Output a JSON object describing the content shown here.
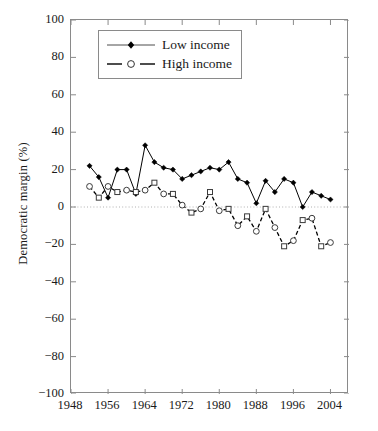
{
  "chart_data": {
    "type": "line",
    "title": "",
    "xlabel": "",
    "ylabel": "Democratic margin (%)",
    "xlim": [
      1948,
      2008
    ],
    "ylim": [
      -100,
      100
    ],
    "grid": false,
    "zero_line": true,
    "legend_position": "top-left",
    "x_ticks": [
      1948,
      1956,
      1964,
      1972,
      1980,
      1988,
      1996,
      2004
    ],
    "y_ticks": [
      100,
      80,
      60,
      40,
      20,
      0,
      -20,
      -40,
      -60,
      -80,
      -100
    ],
    "x": [
      1952,
      1954,
      1956,
      1958,
      1960,
      1962,
      1964,
      1966,
      1968,
      1970,
      1972,
      1974,
      1976,
      1978,
      1980,
      1982,
      1984,
      1986,
      1988,
      1990,
      1992,
      1994,
      1996,
      1998,
      2000,
      2002,
      2004
    ],
    "series": [
      {
        "name": "Low income",
        "marker": "filled-diamond",
        "line": "solid",
        "color": "#000000",
        "values": [
          22,
          16,
          5,
          20,
          20,
          7,
          33,
          24,
          21,
          20,
          15,
          17,
          19,
          21,
          20,
          24,
          15,
          13,
          2,
          14,
          8,
          15,
          13,
          0,
          8,
          6,
          4
        ]
      },
      {
        "name": "High income",
        "marker": "open-circle",
        "line": "dashed",
        "color": "#000000",
        "values": [
          11,
          5,
          11,
          8,
          9,
          8,
          9,
          13,
          7,
          7,
          1,
          -3,
          -1,
          8,
          -2,
          -1,
          -10,
          -5,
          -13,
          -1,
          -11,
          -21,
          -18,
          -7,
          -6,
          -21,
          -19
        ]
      }
    ]
  },
  "legend": {
    "items": [
      {
        "label": "Low income"
      },
      {
        "label": "High income"
      }
    ]
  }
}
